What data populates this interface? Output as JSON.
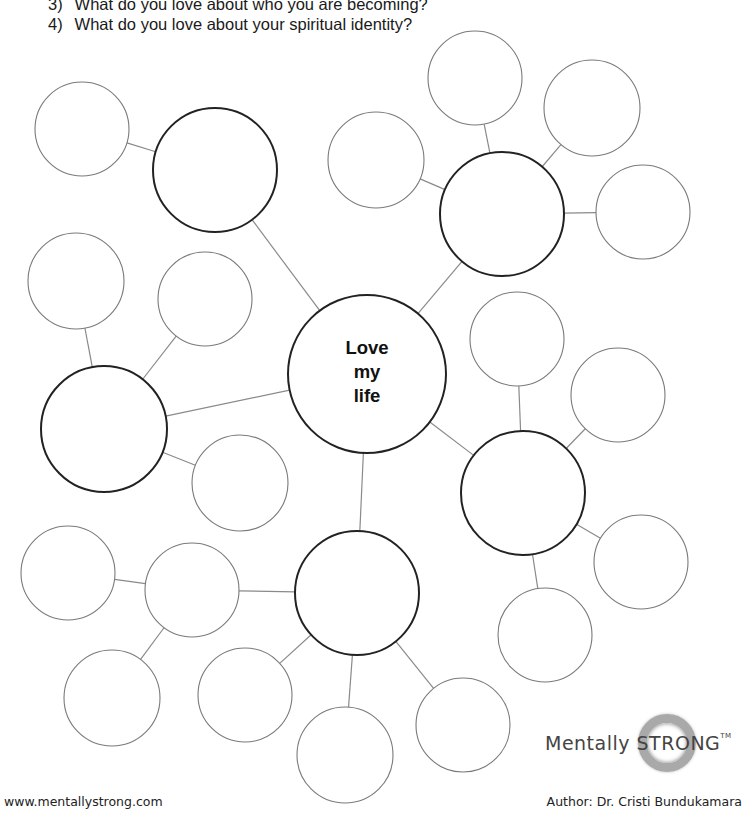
{
  "questions": [
    {
      "num": "3)",
      "text": "What do you love about who you are becoming?"
    },
    {
      "num": "4)",
      "text": "What do you love about your spiritual identity?"
    }
  ],
  "center": {
    "line1": "Love",
    "line2": "my",
    "line3": "life",
    "cx": 367,
    "cy": 374,
    "r": 79
  },
  "hubs": [
    {
      "id": "top-left",
      "cx": 215,
      "cy": 170,
      "r": 62,
      "satellites": [
        {
          "cx": 82,
          "cy": 129,
          "r": 47
        }
      ]
    },
    {
      "id": "top-right",
      "cx": 502,
      "cy": 214,
      "r": 62,
      "satellites": [
        {
          "cx": 475,
          "cy": 78,
          "r": 47
        },
        {
          "cx": 592,
          "cy": 108,
          "r": 48
        },
        {
          "cx": 643,
          "cy": 212,
          "r": 47
        },
        {
          "cx": 376,
          "cy": 160,
          "r": 48
        }
      ]
    },
    {
      "id": "left",
      "cx": 104,
      "cy": 429,
      "r": 63,
      "satellites": [
        {
          "cx": 76,
          "cy": 281,
          "r": 48
        },
        {
          "cx": 205,
          "cy": 299,
          "r": 47
        },
        {
          "cx": 240,
          "cy": 483,
          "r": 48
        }
      ]
    },
    {
      "id": "right",
      "cx": 523,
      "cy": 493,
      "r": 62,
      "satellites": [
        {
          "cx": 517,
          "cy": 339,
          "r": 47
        },
        {
          "cx": 618,
          "cy": 395,
          "r": 47
        },
        {
          "cx": 641,
          "cy": 562,
          "r": 47
        },
        {
          "cx": 545,
          "cy": 635,
          "r": 47
        }
      ]
    },
    {
      "id": "bottom",
      "cx": 357,
      "cy": 593,
      "r": 62,
      "satellites": [
        {
          "cx": 192,
          "cy": 590,
          "r": 47
        },
        {
          "cx": 245,
          "cy": 695,
          "r": 47
        },
        {
          "cx": 345,
          "cy": 755,
          "r": 48
        },
        {
          "cx": 463,
          "cy": 725,
          "r": 47
        }
      ]
    }
  ],
  "sub_satellites": [
    {
      "parent": {
        "cx": 192,
        "cy": 590,
        "r": 47
      },
      "cx": 68,
      "cy": 573,
      "r": 47
    },
    {
      "parent": {
        "cx": 192,
        "cy": 590,
        "r": 47
      },
      "cx": 112,
      "cy": 698,
      "r": 48
    }
  ],
  "colors": {
    "thick_stroke": "#222222",
    "thin_stroke": "#7a7a7a",
    "line": "#8a8a8a"
  },
  "footer": {
    "url": "www.mentallystrong.com",
    "author": "Author: Dr. Cristi Bundukamara"
  },
  "logo": {
    "text": "Mentally STRONG",
    "tm": "TM"
  }
}
